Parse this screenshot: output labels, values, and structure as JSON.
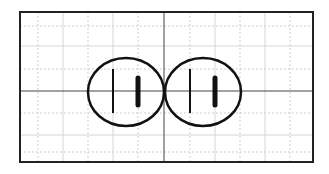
{
  "diagram": {
    "frame": {
      "x": 20,
      "y": 12,
      "width": 293,
      "height": 150,
      "stroke": "#222222",
      "stroke_width": 2
    },
    "grid": {
      "color": "#d6d6d6",
      "minor_color": "#cfcfcf",
      "vertical_solid": [
        63,
        113,
        215,
        265
      ],
      "vertical_dotted": [
        38,
        88,
        138,
        190,
        240,
        290
      ],
      "horizontal_solid": [
        46,
        135
      ],
      "horizontal_dotted": [
        26,
        69,
        113,
        152
      ]
    },
    "axes": {
      "color": "#444444",
      "vertical_x": 164,
      "horizontal_y": 91
    },
    "symbols": [
      {
        "name": "left-cell",
        "cx": 126,
        "cy": 92,
        "rx": 38,
        "ry": 34,
        "thin_plate": {
          "x": 113,
          "y1": 69,
          "y2": 113
        },
        "thick_plate": {
          "x": 138,
          "y1": 78,
          "y2": 105,
          "width": 5
        }
      },
      {
        "name": "right-cell",
        "cx": 203,
        "cy": 92,
        "rx": 38,
        "ry": 34,
        "thin_plate": {
          "x": 190,
          "y1": 69,
          "y2": 113
        },
        "thick_plate": {
          "x": 215,
          "y1": 78,
          "y2": 105,
          "width": 5
        }
      }
    ],
    "stroke_color": "#111111"
  }
}
